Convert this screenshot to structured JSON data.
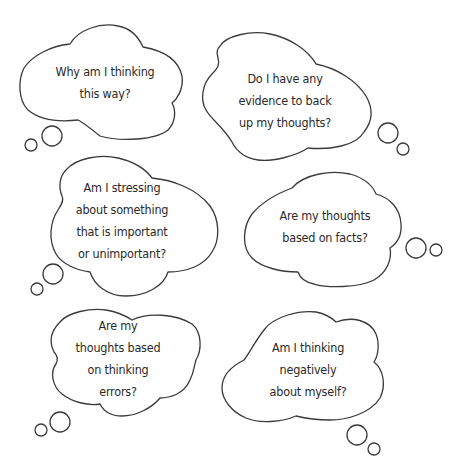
{
  "page": {
    "background": "#ffffff",
    "stroke_color": "#3a3a3a",
    "text_color": "#2a2a2a"
  },
  "bubbles": [
    {
      "id": "why-thinking",
      "lines": [
        "Why am I thinking",
        "this way?"
      ]
    },
    {
      "id": "evidence",
      "lines": [
        "Do I have any",
        "evidence to back",
        "up my thoughts?"
      ]
    },
    {
      "id": "stressing",
      "lines": [
        "Am I stressing",
        "about something",
        "that is important",
        "or unimportant?"
      ]
    },
    {
      "id": "facts",
      "lines": [
        "Are my thoughts",
        "based on facts?"
      ]
    },
    {
      "id": "thinking-errors",
      "lines": [
        "Are my",
        "thoughts based",
        "on thinking",
        "errors?"
      ]
    },
    {
      "id": "negative-self",
      "lines": [
        "Am I thinking",
        "negatively",
        "about myself?"
      ]
    }
  ]
}
